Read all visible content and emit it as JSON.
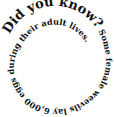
{
  "graphic": {
    "headline": "Did you know?",
    "body": " Some female weevils lay 6,000 eggs during their adult lives.",
    "text_color": "#111111",
    "background": "#ffffff"
  }
}
